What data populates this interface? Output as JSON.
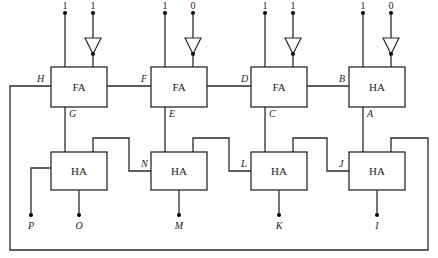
{
  "diagram": {
    "type": "adder-circuit",
    "top_row": [
      {
        "type": "FA",
        "inputs": [
          "1",
          "1"
        ],
        "inverted_input": 2,
        "left_label": "H",
        "bottom_label": "G"
      },
      {
        "type": "FA",
        "inputs": [
          "1",
          "0"
        ],
        "inverted_input": 2,
        "left_label": "F",
        "bottom_label": "E"
      },
      {
        "type": "FA",
        "inputs": [
          "1",
          "1"
        ],
        "inverted_input": 2,
        "left_label": "D",
        "bottom_label": "C"
      },
      {
        "type": "HA",
        "inputs": [
          "1",
          "0"
        ],
        "inverted_input": 2,
        "left_label": "B",
        "bottom_label": "A"
      }
    ],
    "bottom_row": [
      {
        "type": "HA",
        "output": "O",
        "left_label": "",
        "extra_output": "P"
      },
      {
        "type": "HA",
        "output": "M",
        "left_label": "N"
      },
      {
        "type": "HA",
        "output": "K",
        "left_label": "L"
      },
      {
        "type": "HA",
        "output": "I",
        "left_label": "J"
      }
    ],
    "feedback": "H loops to fourth bottom HA"
  }
}
